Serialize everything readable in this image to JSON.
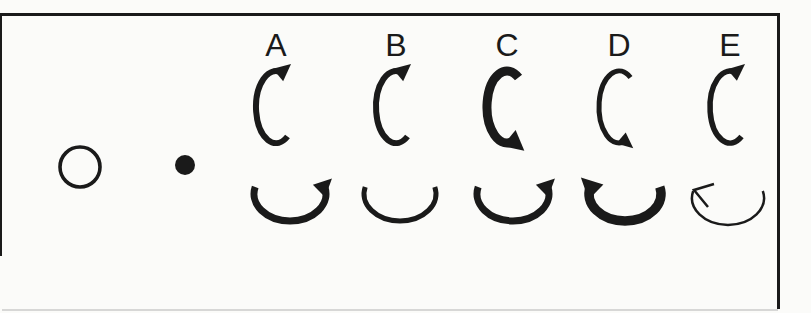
{
  "figure": {
    "colors": {
      "ink": "#1a1a1a",
      "paper": "#fbfbf9"
    },
    "frame": {
      "visible_sides": [
        "top",
        "left",
        "right"
      ],
      "bottom_edge": "faint"
    },
    "stimulus": {
      "open_circle": {
        "name": "open-circle",
        "fill": "none"
      },
      "filled_dot": {
        "name": "filled-dot",
        "fill": "solid"
      }
    },
    "options": [
      {
        "label": "A",
        "top_arrow": {
          "shape": "c-arc",
          "rotation": "clockwise",
          "head_position": "top-right",
          "head_style": "filled",
          "weight_px": 6
        },
        "bottom_arrow": {
          "shape": "u-arc",
          "rotation": "counterclockwise",
          "head_position": "right",
          "head_style": "filled",
          "weight_px": 7
        }
      },
      {
        "label": "B",
        "top_arrow": {
          "shape": "c-arc",
          "rotation": "clockwise",
          "head_position": "top-right",
          "head_style": "filled",
          "weight_px": 6
        },
        "bottom_arrow": {
          "shape": "u-arc",
          "rotation": "none",
          "head_position": "none",
          "head_style": "none",
          "weight_px": 5
        }
      },
      {
        "label": "C",
        "top_arrow": {
          "shape": "c-arc",
          "rotation": "counterclockwise",
          "head_position": "bottom-right",
          "head_style": "filled",
          "weight_px": 9
        },
        "bottom_arrow": {
          "shape": "u-arc",
          "rotation": "counterclockwise",
          "head_position": "right",
          "head_style": "filled",
          "weight_px": 7
        }
      },
      {
        "label": "D",
        "top_arrow": {
          "shape": "c-arc",
          "rotation": "counterclockwise",
          "head_position": "bottom-right",
          "head_style": "filled",
          "weight_px": 5
        },
        "bottom_arrow": {
          "shape": "u-arc",
          "rotation": "clockwise",
          "head_position": "left",
          "head_style": "filled",
          "weight_px": 9.5
        }
      },
      {
        "label": "E",
        "top_arrow": {
          "shape": "c-arc",
          "rotation": "clockwise",
          "head_position": "top-right",
          "head_style": "filled",
          "weight_px": 5.5
        },
        "bottom_arrow": {
          "shape": "u-arc",
          "rotation": "clockwise",
          "head_position": "left",
          "head_style": "open",
          "weight_px": 2.5
        }
      }
    ]
  }
}
